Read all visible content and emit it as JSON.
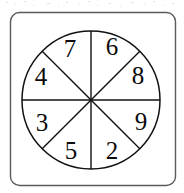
{
  "figure": {
    "kind": "spinner-wheel",
    "title": "",
    "background_color": "#ffffff",
    "stroke_color": "#111111",
    "frame_color": "#5a5a5a",
    "label_color": "#0b0b0b"
  },
  "frame": {
    "x": 10,
    "y": 12,
    "width": 165,
    "height": 173,
    "corner_radius": 9
  },
  "wheel": {
    "center_x": 91,
    "center_y": 100,
    "radius": 69,
    "sector_count": 8,
    "label_radius": 50,
    "divider_angles_deg": [
      0,
      45,
      90,
      135
    ],
    "sectors": [
      {
        "label": "6",
        "start_deg": 270,
        "end_deg": 315,
        "mid_deg": 292.5,
        "label_x": 112,
        "label_y": 46
      },
      {
        "label": "8",
        "start_deg": 315,
        "end_deg": 360,
        "mid_deg": 337.5,
        "label_x": 138,
        "label_y": 75
      },
      {
        "label": "9",
        "start_deg": 0,
        "end_deg": 45,
        "mid_deg": 22.5,
        "label_x": 141,
        "label_y": 121
      },
      {
        "label": "2",
        "start_deg": 45,
        "end_deg": 90,
        "mid_deg": 67.5,
        "label_x": 112,
        "label_y": 150
      },
      {
        "label": "5",
        "start_deg": 90,
        "end_deg": 135,
        "mid_deg": 112.5,
        "label_x": 71,
        "label_y": 150
      },
      {
        "label": "3",
        "start_deg": 135,
        "end_deg": 180,
        "mid_deg": 157.5,
        "label_x": 42,
        "label_y": 122
      },
      {
        "label": "4",
        "start_deg": 180,
        "end_deg": 225,
        "mid_deg": 202.5,
        "label_x": 41,
        "label_y": 76
      },
      {
        "label": "7",
        "start_deg": 225,
        "end_deg": 270,
        "mid_deg": 247.5,
        "label_x": 70,
        "label_y": 48
      }
    ]
  },
  "chart_data": {
    "type": "pie",
    "title": "",
    "xlabel": "",
    "ylabel": "",
    "categories": [
      "6",
      "8",
      "9",
      "2",
      "5",
      "3",
      "4",
      "7"
    ],
    "values": [
      12.5,
      12.5,
      12.5,
      12.5,
      12.5,
      12.5,
      12.5,
      12.5
    ],
    "units": "percent",
    "legend": "none",
    "grid": false
  }
}
